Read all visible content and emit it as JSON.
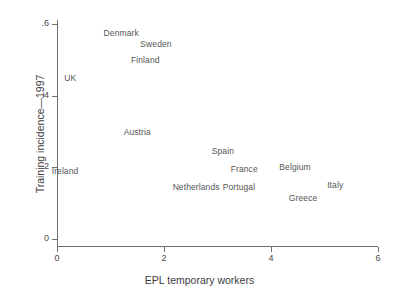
{
  "chart_data": {
    "type": "scatter",
    "title": "",
    "xlabel": "EPL temporary workers",
    "ylabel": "Training incidence—1997",
    "xlim": [
      0,
      6
    ],
    "ylim": [
      0,
      0.6
    ],
    "xticks": [
      "0",
      "2",
      "4",
      "6"
    ],
    "xtick_values": [
      0,
      2,
      4,
      6
    ],
    "yticks": [
      ".6",
      ".4",
      ".2",
      "0"
    ],
    "ytick_values": [
      0.6,
      0.4,
      0.2,
      0.0
    ],
    "grid": false,
    "legend": null,
    "marker_style": "text-label-only",
    "points": [
      {
        "label": "Denmark",
        "x": 1.2,
        "y": 0.575
      },
      {
        "label": "Sweden",
        "x": 1.85,
        "y": 0.545
      },
      {
        "label": "Finland",
        "x": 1.65,
        "y": 0.5
      },
      {
        "label": "UK",
        "x": 0.25,
        "y": 0.45
      },
      {
        "label": "Austria",
        "x": 1.5,
        "y": 0.3
      },
      {
        "label": "Spain",
        "x": 3.1,
        "y": 0.245
      },
      {
        "label": "France",
        "x": 3.5,
        "y": 0.195
      },
      {
        "label": "Belgium",
        "x": 4.45,
        "y": 0.2
      },
      {
        "label": "Ireland",
        "x": 0.15,
        "y": 0.19
      },
      {
        "label": "Italy",
        "x": 5.2,
        "y": 0.15
      },
      {
        "label": "Netherlands",
        "x": 2.6,
        "y": 0.145
      },
      {
        "label": "Portugal",
        "x": 3.4,
        "y": 0.145
      },
      {
        "label": "Greece",
        "x": 4.6,
        "y": 0.115
      }
    ]
  },
  "colors": {
    "axis": "#6e6e6e",
    "text": "#4a4a4a",
    "label": "#555555",
    "background": "#ffffff"
  }
}
